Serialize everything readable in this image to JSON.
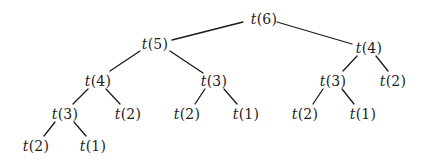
{
  "diagram": {
    "type": "recursion-tree",
    "function_symbol": "t",
    "colors": {
      "background": "#ffffff",
      "edge": "#1a1a1a",
      "text": "#1e1e1e"
    },
    "nodes": [
      {
        "id": "n6",
        "fn": "t",
        "arg": "(6)",
        "x": 264,
        "y": 19
      },
      {
        "id": "n5",
        "fn": "t",
        "arg": "(5)",
        "x": 155,
        "y": 44
      },
      {
        "id": "n4r",
        "fn": "t",
        "arg": "(4)",
        "x": 369,
        "y": 48
      },
      {
        "id": "n4l",
        "fn": "t",
        "arg": "(4)",
        "x": 98,
        "y": 81
      },
      {
        "id": "n3m",
        "fn": "t",
        "arg": "(3)",
        "x": 214,
        "y": 81
      },
      {
        "id": "n3r",
        "fn": "t",
        "arg": "(3)",
        "x": 333,
        "y": 81
      },
      {
        "id": "n2r",
        "fn": "t",
        "arg": "(2)",
        "x": 393,
        "y": 81
      },
      {
        "id": "n3l",
        "fn": "t",
        "arg": "(3)",
        "x": 65,
        "y": 114
      },
      {
        "id": "n2l",
        "fn": "t",
        "arg": "(2)",
        "x": 128,
        "y": 114
      },
      {
        "id": "n2m",
        "fn": "t",
        "arg": "(2)",
        "x": 187,
        "y": 114
      },
      {
        "id": "n1m",
        "fn": "t",
        "arg": "(1)",
        "x": 246,
        "y": 114
      },
      {
        "id": "n2rr",
        "fn": "t",
        "arg": "(2)",
        "x": 305,
        "y": 114
      },
      {
        "id": "n1r",
        "fn": "t",
        "arg": "(1)",
        "x": 363,
        "y": 114
      },
      {
        "id": "n2ll",
        "fn": "t",
        "arg": "(2)",
        "x": 36,
        "y": 146
      },
      {
        "id": "n1ll",
        "fn": "t",
        "arg": "(1)",
        "x": 93,
        "y": 146
      }
    ],
    "edges": [
      {
        "from": "n6",
        "to": "n5",
        "x1": 243,
        "y1": 22,
        "x2": 172,
        "y2": 40
      },
      {
        "from": "n6",
        "to": "n4r",
        "x1": 277,
        "y1": 22,
        "x2": 352,
        "y2": 44
      },
      {
        "from": "n5",
        "to": "n4l",
        "x1": 140,
        "y1": 51,
        "x2": 110,
        "y2": 71
      },
      {
        "from": "n5",
        "to": "n3m",
        "x1": 170,
        "y1": 51,
        "x2": 203,
        "y2": 73
      },
      {
        "from": "n4r",
        "to": "n3r",
        "x1": 357,
        "y1": 56,
        "x2": 343,
        "y2": 71
      },
      {
        "from": "n4r",
        "to": "n2r",
        "x1": 376,
        "y1": 56,
        "x2": 388,
        "y2": 71
      },
      {
        "from": "n4l",
        "to": "n3l",
        "x1": 88,
        "y1": 89,
        "x2": 73,
        "y2": 104
      },
      {
        "from": "n4l",
        "to": "n2l",
        "x1": 106,
        "y1": 89,
        "x2": 120,
        "y2": 104
      },
      {
        "from": "n3m",
        "to": "n2m",
        "x1": 205,
        "y1": 89,
        "x2": 195,
        "y2": 104
      },
      {
        "from": "n3m",
        "to": "n1m",
        "x1": 224,
        "y1": 89,
        "x2": 237,
        "y2": 104
      },
      {
        "from": "n3r",
        "to": "n2rr",
        "x1": 323,
        "y1": 89,
        "x2": 313,
        "y2": 104
      },
      {
        "from": "n3r",
        "to": "n1r",
        "x1": 342,
        "y1": 89,
        "x2": 354,
        "y2": 104
      },
      {
        "from": "n3l",
        "to": "n2ll",
        "x1": 55,
        "y1": 122,
        "x2": 44,
        "y2": 136
      },
      {
        "from": "n3l",
        "to": "n1ll",
        "x1": 74,
        "y1": 122,
        "x2": 86,
        "y2": 136
      }
    ]
  }
}
